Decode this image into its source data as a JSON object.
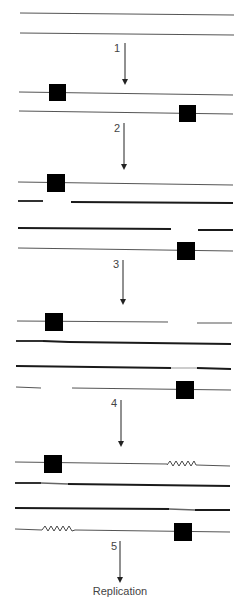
{
  "diagram": {
    "type": "dna-repair-process",
    "stages": [
      {
        "name": "intact-duplex",
        "strands": 2,
        "lesions": 0
      },
      {
        "name": "damaged-duplex",
        "strands": 2,
        "lesions": 2
      },
      {
        "name": "incised-strands",
        "strands": 4,
        "lesions": 2
      },
      {
        "name": "gapped-strands",
        "strands": 4,
        "lesions": 2
      },
      {
        "name": "filled-recombined",
        "strands": 4,
        "lesions": 2,
        "repair_patches": 2
      }
    ],
    "steps": [
      {
        "label": "1"
      },
      {
        "label": "2"
      },
      {
        "label": "3"
      },
      {
        "label": "4"
      },
      {
        "label": "5"
      }
    ],
    "final_label": "Replication",
    "colors": {
      "lesion": "#000000",
      "strand": "#555555",
      "new_strand": "#1a1a1a"
    }
  }
}
